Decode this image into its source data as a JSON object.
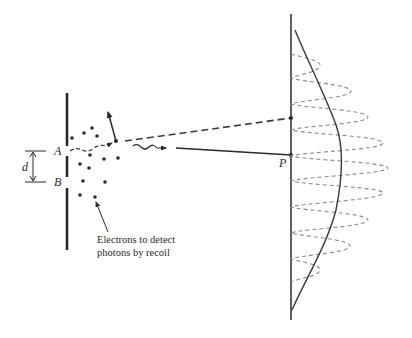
{
  "diagram": {
    "labels": {
      "slit_a": "A",
      "slit_b": "B",
      "separation": "d",
      "screen_point": "P"
    },
    "caption": {
      "line1": "Electrons to detect",
      "line2": "photons by recoil"
    },
    "colors": {
      "ink": "#2a2a2a",
      "dashed_pattern": "#8a8a8a",
      "background": "#ffffff"
    }
  }
}
